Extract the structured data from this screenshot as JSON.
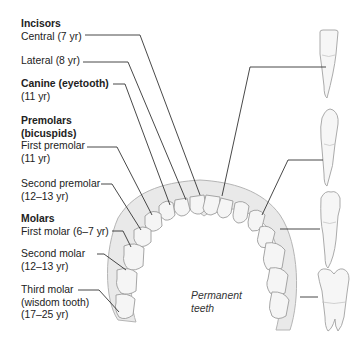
{
  "title": "Permanent teeth",
  "caption": [
    "Permanent",
    "teeth"
  ],
  "groups": [
    {
      "heading": "Incisors",
      "items": [
        {
          "label": "Central (7 yr)",
          "eruption": "7 yr"
        },
        {
          "label": "Lateral (8 yr)",
          "eruption": "8 yr"
        }
      ]
    },
    {
      "heading": "Canine (eyetooth)",
      "items": [
        {
          "label": "(11 yr)",
          "eruption": "11 yr"
        }
      ]
    },
    {
      "heading": "Premolars",
      "subheading": "(bicuspids)",
      "items": [
        {
          "label": "First premolar",
          "sub": "(11 yr)",
          "eruption": "11 yr"
        },
        {
          "label": "Second premolar",
          "sub": "(12–13 yr)",
          "eruption": "12–13 yr"
        }
      ]
    },
    {
      "heading": "Molars",
      "items": [
        {
          "label": "First molar (6–7 yr)",
          "eruption": "6–7 yr"
        },
        {
          "label": "Second molar",
          "sub": "(12–13 yr)",
          "eruption": "12–13 yr"
        },
        {
          "label": "Third molar",
          "sub": "(wisdom tooth)",
          "sub2": "(17–25 yr)",
          "eruption": "17–25 yr"
        }
      ]
    }
  ],
  "side_teeth": [
    {
      "name": "incisor"
    },
    {
      "name": "canine"
    },
    {
      "name": "premolar"
    },
    {
      "name": "molar"
    }
  ],
  "colors": {
    "line": "#333333",
    "tooth_fill": "#f4f4f4",
    "tooth_stroke": "#9a9a9a",
    "gum": "#e6e6e6"
  }
}
